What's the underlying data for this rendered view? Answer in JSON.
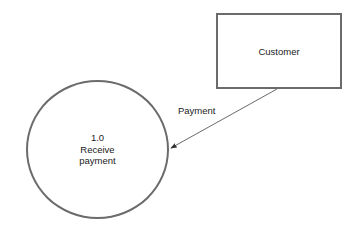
{
  "diagram": {
    "type": "data-flow-diagram",
    "entities": [
      {
        "id": "customer",
        "label": "Customer",
        "shape": "rectangle"
      }
    ],
    "processes": [
      {
        "id": "p1",
        "number": "1.0",
        "name_line1": "Receive",
        "name_line2": "payment",
        "shape": "circle"
      }
    ],
    "flows": [
      {
        "from": "customer",
        "to": "p1",
        "label": "Payment"
      }
    ],
    "colors": {
      "stroke": "#6b6b6b",
      "text": "#222222",
      "background": "#ffffff"
    }
  }
}
